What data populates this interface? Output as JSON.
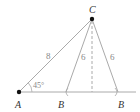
{
  "diagram": {
    "type": "ambiguous-case-triangle",
    "points": {
      "A": {
        "label": "A",
        "x": 19,
        "y": 92
      },
      "C": {
        "label": "C",
        "x": 92,
        "y": 19
      },
      "B1": {
        "label": "B",
        "x": 66,
        "y": 92
      },
      "B2": {
        "label": "B",
        "x": 118,
        "y": 92
      }
    },
    "side_labels": {
      "AC": "8",
      "CB1": "6",
      "CB2": "6"
    },
    "angle_label": "45°",
    "colors": {
      "line": "#aaaaaa",
      "point": "#111111",
      "label": "#333333",
      "number": "#888888"
    }
  }
}
